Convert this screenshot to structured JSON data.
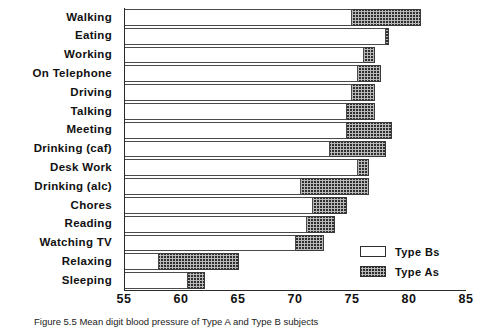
{
  "chart_data": {
    "type": "bar",
    "orientation": "horizontal",
    "title": "",
    "xlabel": "",
    "ylabel": "",
    "xlim": [
      55,
      85
    ],
    "xticks": [
      55,
      60,
      65,
      70,
      75,
      80,
      85
    ],
    "grid": false,
    "legend_position": "bottom-right",
    "categories": [
      "Walking",
      "Eating",
      "Working",
      "On Telephone",
      "Driving",
      "Talking",
      "Meeting",
      "Drinking (caf)",
      "Desk Work",
      "Drinking (alc)",
      "Chores",
      "Reading",
      "Watching TV",
      "Relaxing",
      "Sleeping"
    ],
    "series": [
      {
        "name": "Type Bs",
        "fill": "open",
        "values": [
          75.0,
          78.0,
          76.0,
          75.5,
          75.0,
          74.5,
          74.5,
          73.0,
          75.5,
          70.5,
          71.5,
          71.0,
          70.0,
          58.0,
          60.5
        ]
      },
      {
        "name": "Type As",
        "fill": "hatched",
        "values": [
          81.0,
          78.2,
          77.0,
          77.5,
          77.0,
          77.0,
          78.5,
          78.0,
          76.5,
          76.5,
          74.5,
          73.5,
          72.5,
          65.0,
          62.0
        ]
      }
    ]
  },
  "legend": {
    "items": [
      {
        "label": "Type Bs",
        "swatch": "open-rectangle"
      },
      {
        "label": "Type As",
        "swatch": "hatched-rectangle"
      }
    ]
  },
  "caption": {
    "text": "Figure 5.5   Mean digit blood pressure of Type A and Type B subjects"
  },
  "colors": {
    "axis": "#2a2a2a",
    "bar_outline": "#3a3a3a",
    "hatch": "#282828",
    "background": "#ffffff"
  }
}
